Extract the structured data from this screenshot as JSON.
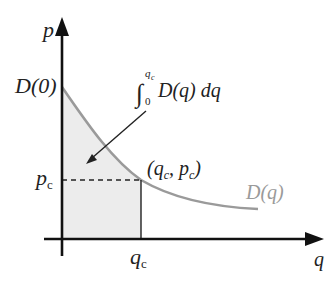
{
  "diagram": {
    "axes": {
      "y_label": "p",
      "x_label": "q"
    },
    "labels": {
      "d0": "D(0)",
      "integral_lower": "0",
      "integral_upper": "q",
      "integral_upper_sub": "c",
      "integral_body": "D(q) dq",
      "point_open": "(q",
      "point_sub1": "c",
      "point_mid": ", p",
      "point_sub2": "c",
      "point_close": ")",
      "pc": "p",
      "pc_sub": "c",
      "qc": "q",
      "qc_sub": "c",
      "curve_label": "D(q)"
    },
    "colors": {
      "axis": "#111111",
      "curve": "#9a9a9a",
      "shade": "#ececec",
      "curve_label": "#9a9a9a"
    }
  }
}
